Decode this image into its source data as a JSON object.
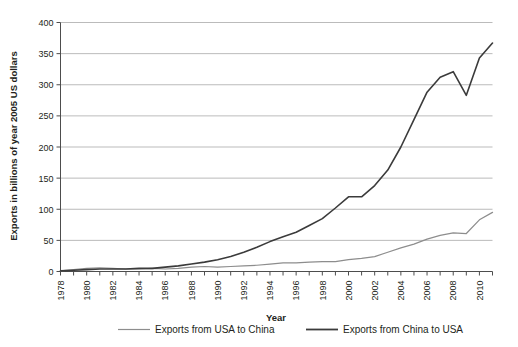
{
  "chart_data": {
    "type": "line",
    "title": "",
    "xlabel": "Year",
    "ylabel": "Exports in billions of year 2005 US dollars",
    "xlim": [
      1978,
      2011
    ],
    "ylim": [
      0,
      400
    ],
    "yticks": [
      0,
      50,
      100,
      150,
      200,
      250,
      300,
      350,
      400
    ],
    "ytick_labels": [
      "0",
      "50",
      "100",
      "150",
      "200",
      "250",
      "300",
      "350",
      "400"
    ],
    "xticks": [
      1978,
      1979,
      1980,
      1981,
      1982,
      1983,
      1984,
      1985,
      1986,
      1987,
      1988,
      1989,
      1990,
      1991,
      1992,
      1993,
      1994,
      1995,
      1996,
      1997,
      1998,
      1999,
      2000,
      2001,
      2002,
      2003,
      2004,
      2005,
      2006,
      2007,
      2008,
      2009,
      2010,
      2011
    ],
    "xtick_labels": [
      "1978",
      "1980",
      "1982",
      "1984",
      "1986",
      "1988",
      "1990",
      "1992",
      "1994",
      "1996",
      "1998",
      "2000",
      "2002",
      "2004",
      "2006",
      "2008",
      "2010"
    ],
    "xtick_label_years": [
      1978,
      1980,
      1982,
      1984,
      1986,
      1988,
      1990,
      1992,
      1994,
      1996,
      1998,
      2000,
      2002,
      2004,
      2006,
      2008,
      2010
    ],
    "grid": true,
    "grid_axis": "y",
    "legend_position": "bottom",
    "x": [
      1978,
      1979,
      1980,
      1981,
      1982,
      1983,
      1984,
      1985,
      1986,
      1987,
      1988,
      1989,
      1990,
      1991,
      1992,
      1993,
      1994,
      1995,
      1996,
      1997,
      1998,
      1999,
      2000,
      2001,
      2002,
      2003,
      2004,
      2005,
      2006,
      2007,
      2008,
      2009,
      2010,
      2011
    ],
    "series": [
      {
        "name": "Exports from USA to China",
        "color": "#8d8d8d",
        "width": 1.2,
        "values": [
          1,
          3,
          5,
          6,
          5,
          4,
          4,
          5,
          4,
          5,
          7,
          8,
          7,
          8,
          9,
          10,
          12,
          14,
          14,
          15,
          16,
          16,
          19,
          21,
          24,
          31,
          38,
          44,
          52,
          58,
          62,
          61,
          83,
          95
        ]
      },
      {
        "name": "Exports from China to USA",
        "color": "#3b3b3b",
        "width": 1.6,
        "values": [
          1,
          2,
          3,
          4,
          4,
          4,
          5,
          5,
          7,
          9,
          12,
          15,
          19,
          24,
          31,
          39,
          48,
          56,
          63,
          74,
          85,
          102,
          120,
          120,
          138,
          163,
          200,
          244,
          288,
          312,
          321,
          283,
          343,
          367
        ]
      }
    ]
  },
  "legend": {
    "items": [
      {
        "label": "Exports from USA to China",
        "color": "#8d8d8d"
      },
      {
        "label": "Exports from China to USA",
        "color": "#3b3b3b"
      }
    ]
  }
}
